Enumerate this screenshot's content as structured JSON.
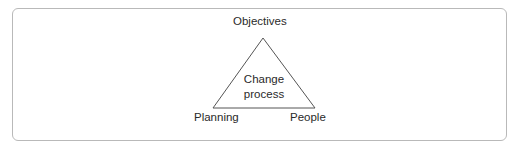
{
  "diagram": {
    "type": "triangle",
    "vertices": {
      "top": "Objectives",
      "bottom_left": "Planning",
      "bottom_right": "People"
    },
    "center_label_line1": "Change",
    "center_label_line2": "process",
    "colors": {
      "border": "#b9b9b9",
      "line": "#555555",
      "text": "#2a2a2a"
    }
  }
}
